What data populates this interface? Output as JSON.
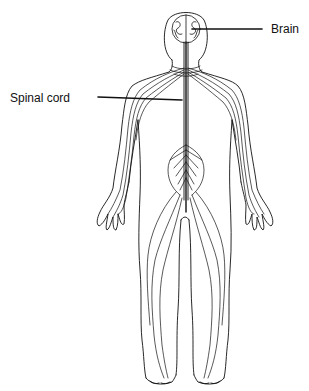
{
  "diagram": {
    "labels": [
      {
        "id": "brain",
        "text": "Brain"
      },
      {
        "id": "spinal_cord",
        "text": "Spinal cord"
      }
    ],
    "colors": {
      "line": "#111111",
      "background": "#ffffff"
    }
  }
}
